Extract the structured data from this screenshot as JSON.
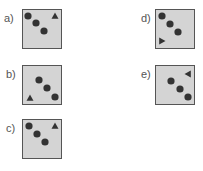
{
  "options": [
    {
      "label": "a)",
      "x": 22,
      "y": 9,
      "lx": 4,
      "ly": 12,
      "dots": [
        [
          5,
          6
        ],
        [
          13,
          13
        ],
        [
          21,
          21
        ]
      ],
      "triangle": {
        "x": 32,
        "y": 6,
        "dir": "up"
      }
    },
    {
      "label": "b)",
      "x": 22,
      "y": 65,
      "lx": 6,
      "ly": 68,
      "dots": [
        [
          16,
          14
        ],
        [
          24,
          22
        ],
        [
          32,
          31
        ]
      ],
      "triangle": {
        "x": 7,
        "y": 32,
        "dir": "up"
      }
    },
    {
      "label": "c)",
      "x": 22,
      "y": 119,
      "lx": 6,
      "ly": 122,
      "dots": [
        [
          6,
          6
        ],
        [
          14,
          14
        ],
        [
          22,
          22
        ]
      ],
      "triangle": {
        "x": 32,
        "y": 6,
        "dir": "up"
      }
    },
    {
      "label": "d)",
      "x": 155,
      "y": 9,
      "lx": 141,
      "ly": 12,
      "dots": [
        [
          6,
          6
        ],
        [
          14,
          14
        ],
        [
          22,
          22
        ]
      ],
      "triangle": {
        "x": 6,
        "y": 31,
        "dir": "right"
      }
    },
    {
      "label": "e)",
      "x": 155,
      "y": 65,
      "lx": 141,
      "ly": 68,
      "dots": [
        [
          15,
          15
        ],
        [
          24,
          23
        ],
        [
          32,
          31
        ]
      ],
      "triangle": {
        "x": 32,
        "y": 8,
        "dir": "left"
      }
    }
  ],
  "colors": {
    "box_fill": "#d4d4d4",
    "border": "#555555",
    "shape": "#333333"
  }
}
